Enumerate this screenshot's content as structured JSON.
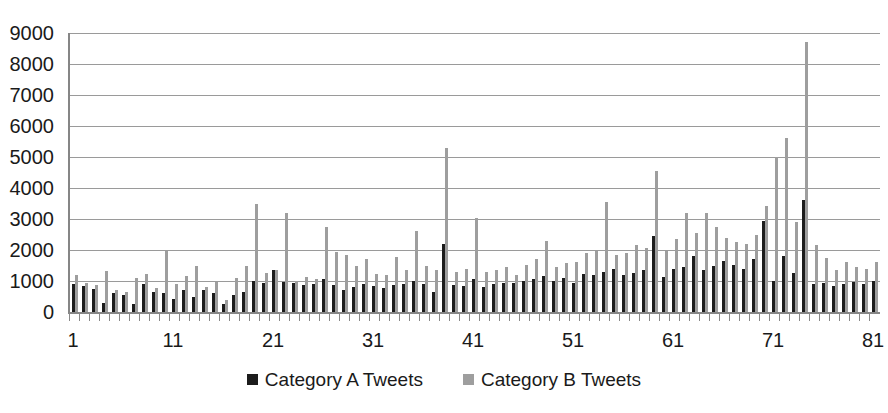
{
  "chart_data": {
    "type": "bar",
    "title": "",
    "subtitle": "",
    "xlabel": "",
    "ylabel": "",
    "ylim": [
      0,
      9000
    ],
    "ytick_step": 1000,
    "yticks": [
      9000,
      8000,
      7000,
      6000,
      5000,
      4000,
      3000,
      2000,
      1000,
      0
    ],
    "ytick_labels": [
      "9000",
      "8000",
      "7000",
      "6000",
      "5000",
      "4000",
      "3000",
      "2000",
      "1000",
      "0"
    ],
    "xlim": [
      1,
      81
    ],
    "xticks": [
      1,
      11,
      21,
      31,
      41,
      51,
      61,
      71,
      81
    ],
    "xtick_labels": [
      "1",
      "11",
      "21",
      "31",
      "41",
      "51",
      "61",
      "71",
      "81"
    ],
    "grid": true,
    "grid_axis": "y",
    "legend_position": "bottom-center",
    "bar_mode": "grouped",
    "categories": [
      1,
      2,
      3,
      4,
      5,
      6,
      7,
      8,
      9,
      10,
      11,
      12,
      13,
      14,
      15,
      16,
      17,
      18,
      19,
      20,
      21,
      22,
      23,
      24,
      25,
      26,
      27,
      28,
      29,
      30,
      31,
      32,
      33,
      34,
      35,
      36,
      37,
      38,
      39,
      40,
      41,
      42,
      43,
      44,
      45,
      46,
      47,
      48,
      49,
      50,
      51,
      52,
      53,
      54,
      55,
      56,
      57,
      58,
      59,
      60,
      61,
      62,
      63,
      64,
      65,
      66,
      67,
      68,
      69,
      70,
      71,
      72,
      73,
      74,
      75,
      76,
      77,
      78,
      79,
      80,
      81
    ],
    "series": [
      {
        "name": "Category A Tweets",
        "color": "#1c1c1c",
        "values": [
          900,
          830,
          750,
          300,
          620,
          540,
          260,
          900,
          650,
          620,
          420,
          700,
          480,
          720,
          620,
          270,
          560,
          640,
          1000,
          950,
          1350,
          980,
          920,
          880,
          900,
          1050,
          880,
          700,
          820,
          900,
          830,
          780,
          860,
          900,
          1000,
          900,
          640,
          2200,
          880,
          830,
          1050,
          820,
          900,
          950,
          930,
          1000,
          1080,
          1150,
          1000,
          1100,
          950,
          1230,
          1180,
          1280,
          1400,
          1200,
          1250,
          1350,
          2450,
          1120,
          1380,
          1450,
          1800,
          1350,
          1500,
          1650,
          1520,
          1400,
          1700,
          2950,
          1000,
          1800,
          1250,
          3600,
          900,
          950,
          830,
          900,
          980,
          900,
          1000
        ]
      },
      {
        "name": "Category B Tweets",
        "color": "#9e9e9e",
        "values": [
          1200,
          950,
          870,
          1320,
          720,
          640,
          1100,
          1230,
          780,
          1980,
          900,
          1150,
          1480,
          820,
          980,
          400,
          1100,
          1480,
          3480,
          1250,
          1350,
          3180,
          1000,
          1130,
          1080,
          2750,
          1950,
          1850,
          1500,
          1700,
          1230,
          1180,
          1780,
          1350,
          2600,
          1500,
          1350,
          5300,
          1280,
          1400,
          3030,
          1280,
          1350,
          1450,
          1200,
          1520,
          1700,
          2280,
          1450,
          1580,
          1620,
          1900,
          1980,
          3560,
          1850,
          1900,
          2150,
          2070,
          4550,
          1980,
          2350,
          3200,
          2550,
          3200,
          2750,
          2380,
          2270,
          2200,
          2480,
          3430,
          5000,
          5620,
          2900,
          8700,
          2150,
          1750,
          1350,
          1600,
          1450,
          1400,
          1620
        ]
      }
    ]
  },
  "legend": {
    "items": [
      {
        "label": "Category A Tweets",
        "color": "#1c1c1c"
      },
      {
        "label": "Category B Tweets",
        "color": "#9e9e9e"
      }
    ]
  }
}
